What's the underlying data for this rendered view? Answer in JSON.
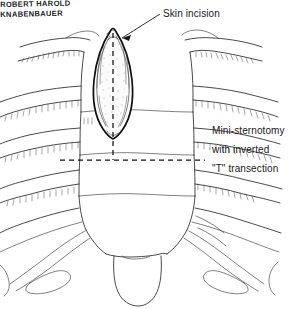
{
  "figure": {
    "kind": "medical-illustration",
    "background_color": "#ffffff",
    "ink_color": "#1c1c1c",
    "width": 301,
    "height": 309
  },
  "labels": {
    "skin_incision": "Skin incision"
  },
  "note": {
    "line1": "Mini-sternotomy",
    "line2": "with inverted",
    "line3": "\"T\" transection"
  },
  "signature": {
    "line1": "ROBERT HAROLD",
    "line2": "KNABENBAUER"
  }
}
